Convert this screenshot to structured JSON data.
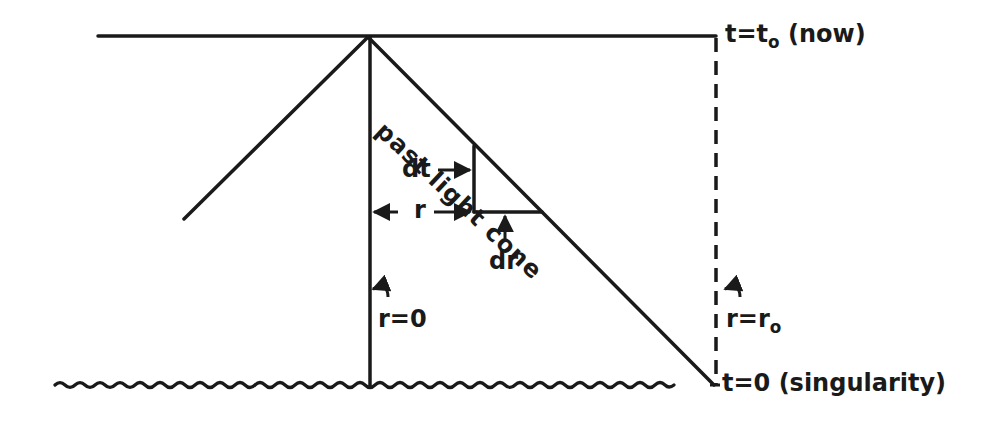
{
  "diagram": {
    "type": "spacetime-diagram",
    "title": "",
    "colors": {
      "ink": "#1a1a1a",
      "background": "#ffffff"
    },
    "labels": {
      "now_prefix": "t=t",
      "now_sub": "o",
      "now_suffix": " (now)",
      "singularity": "t=0 (singularity)",
      "past_light_cone": "past light cone",
      "dt": "dt",
      "r": "r",
      "dr": "dr",
      "r_zero": "r=0",
      "r_o_prefix": "r=r",
      "r_o_sub": "o"
    },
    "elements": {
      "present_time_line": {
        "y": 36,
        "x_start": 98,
        "x_end": 716,
        "style": "solid"
      },
      "observer_worldline": {
        "x": 370,
        "y_start": 36,
        "y_end": 385,
        "label": "r=0"
      },
      "edge_worldline": {
        "x": 716,
        "y_start": 36,
        "y_end": 385,
        "style": "dashed",
        "label": "r=r_o"
      },
      "left_cone_edge": {
        "from": [
          368,
          36
        ],
        "to": [
          183,
          220
        ]
      },
      "past_light_cone_edge": {
        "from": [
          368,
          36
        ],
        "to": [
          714,
          385
        ]
      },
      "differential_triangle": {
        "vertical_x": 474,
        "top_y": 145,
        "bottom_y": 212,
        "horizontal_end_x": 542
      },
      "singularity_line": {
        "y": 385,
        "x_start": 55,
        "x_end": 714,
        "style": "wavy"
      }
    }
  }
}
